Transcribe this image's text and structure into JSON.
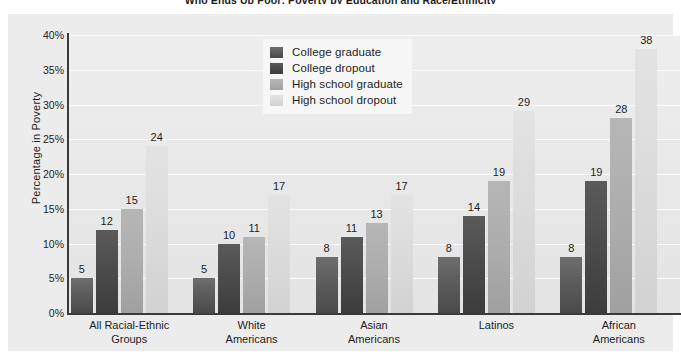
{
  "chart_data": {
    "type": "bar",
    "title": "Who Ends Up Poor: Poverty by Education and Race/Ethnicity",
    "xlabel": "",
    "ylabel": "Percentage in Poverty",
    "ylim": [
      0,
      40
    ],
    "ytick_labels": [
      "40%",
      "35%",
      "30%",
      "25%",
      "20%",
      "15%",
      "10%",
      "5%",
      "0%"
    ],
    "ytick_values": [
      40,
      35,
      30,
      25,
      20,
      15,
      10,
      5,
      0
    ],
    "grid": true,
    "legend_position": "upper-center",
    "categories": [
      "All Racial-Ethnic Groups",
      "White Americans",
      "Asian Americans",
      "Latinos",
      "African Americans"
    ],
    "category_lines": [
      [
        "All Racial-Ethnic",
        "Groups"
      ],
      [
        "White",
        "Americans"
      ],
      [
        "Asian",
        "Americans"
      ],
      [
        "Latinos",
        ""
      ],
      [
        "African",
        "Americans"
      ]
    ],
    "series": [
      {
        "name": "College graduate",
        "color": "#5e5e5e",
        "values": [
          5,
          5,
          8,
          8,
          8
        ],
        "labels": [
          "5",
          "5",
          "8",
          "8",
          "8"
        ]
      },
      {
        "name": "College dropout",
        "color": "#4a4a4a",
        "values": [
          12,
          10,
          11,
          14,
          19
        ],
        "labels": [
          "12",
          "10",
          "11",
          "14",
          "19"
        ]
      },
      {
        "name": "High school graduate",
        "color": "#aeaeae",
        "values": [
          15,
          11,
          13,
          19,
          28
        ],
        "labels": [
          "15",
          "11",
          "13",
          "19",
          "28"
        ]
      },
      {
        "name": "High school dropout",
        "color": "#dcdcdc",
        "values": [
          24,
          17,
          17,
          29,
          38
        ],
        "labels": [
          "24",
          "17",
          "17",
          "29",
          "38"
        ]
      }
    ],
    "colors": {
      "panel_background": "#ececec",
      "plot_background": "#ebebeb",
      "gridline": "#fbfbfb",
      "axis": "#3a3a3a",
      "text": "#1d1d1d",
      "legend_background": "#f7f7f7"
    }
  }
}
